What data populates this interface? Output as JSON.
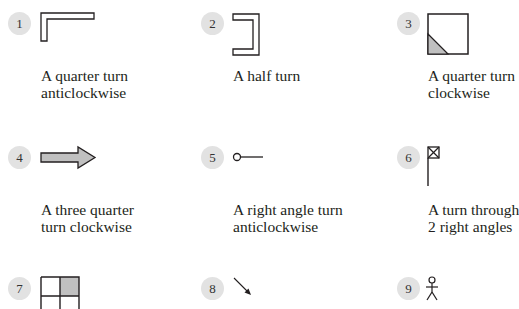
{
  "items": [
    {
      "number": "1",
      "caption_line1": "A quarter turn",
      "caption_line2": "anticlockwise",
      "shape": "l-shape"
    },
    {
      "number": "2",
      "caption_line1": "A half turn",
      "caption_line2": "",
      "shape": "bracket-shape"
    },
    {
      "number": "3",
      "caption_line1": "A quarter turn",
      "caption_line2": "clockwise",
      "shape": "square-with-shaded-corner"
    },
    {
      "number": "4",
      "caption_line1": "A three quarter",
      "caption_line2": "turn clockwise",
      "shape": "arrow-right"
    },
    {
      "number": "5",
      "caption_line1": "A right angle turn",
      "caption_line2": "anticlockwise",
      "shape": "pin-line"
    },
    {
      "number": "6",
      "caption_line1": "A turn through",
      "caption_line2": "2 right angles",
      "shape": "flag"
    },
    {
      "number": "7",
      "caption_line1": "",
      "caption_line2": "",
      "shape": "grid-shaded-top-right"
    },
    {
      "number": "8",
      "caption_line1": "",
      "caption_line2": "",
      "shape": "diagonal-arrow"
    },
    {
      "number": "9",
      "caption_line1": "",
      "caption_line2": "",
      "shape": "stick-figure"
    }
  ],
  "colors": {
    "badge": "#e2e2e2",
    "shade": "#c0c0c0",
    "stroke": "#231f20"
  }
}
